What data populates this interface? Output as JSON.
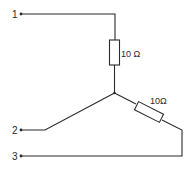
{
  "diagram": {
    "type": "star-network-circuit",
    "terminals": [
      {
        "id": "1",
        "label": "1"
      },
      {
        "id": "2",
        "label": "2"
      },
      {
        "id": "3",
        "label": "3"
      }
    ],
    "resistors": [
      {
        "id": "R1",
        "value": "10 Ω",
        "between": [
          "terminal-1",
          "junction"
        ]
      },
      {
        "id": "R2",
        "value": "10Ω",
        "between": [
          "junction",
          "terminal-3"
        ]
      }
    ],
    "connections": [
      "terminal-2 to junction (direct wire)",
      "terminal-1 via R1 to junction",
      "junction via R2 to terminal-3"
    ],
    "colors": {
      "line": "#2a2a2a",
      "background": "#ffffff"
    }
  }
}
